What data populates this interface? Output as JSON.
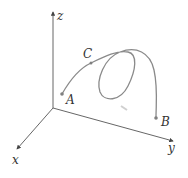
{
  "diagram": {
    "type": "3d-space-curve",
    "axes": {
      "x_label": "x",
      "y_label": "y",
      "z_label": "z"
    },
    "points": {
      "A": "A",
      "B": "B",
      "C": "C"
    },
    "colors": {
      "axis": "#555555",
      "curve": "#8a8a8a",
      "text": "#333333",
      "point": "#808080"
    }
  }
}
